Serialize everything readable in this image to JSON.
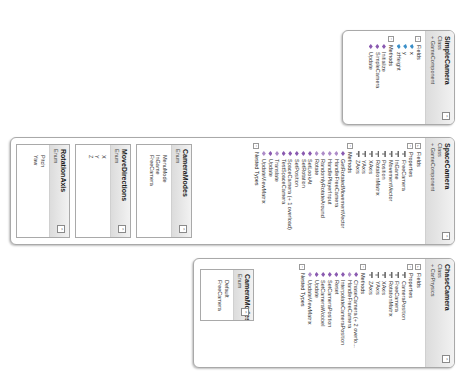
{
  "diagram": {
    "orientation": "rotated 90 degrees clockwise",
    "classes": [
      {
        "name": "SimpleCamera",
        "kind": "Class",
        "base": "+ GameComponent",
        "sections": [
          {
            "title": "Fields",
            "toggle": "−",
            "members": [
              {
                "name": "x",
                "type": "field"
              },
              {
                "name": "y",
                "type": "field"
              },
              {
                "name": "zHeight",
                "type": "field"
              }
            ]
          },
          {
            "title": "Methods",
            "toggle": "−",
            "members": [
              {
                "name": "Initialize",
                "type": "method"
              },
              {
                "name": "SimpleCamera",
                "type": "method"
              },
              {
                "name": "Update",
                "type": "method"
              }
            ]
          }
        ]
      },
      {
        "name": "SpaceCamera",
        "kind": "Class",
        "base": "+ GameComponent",
        "sections": [
          {
            "title": "Fields",
            "toggle": "+",
            "members": []
          },
          {
            "title": "Properties",
            "toggle": "−",
            "members": [
              {
                "name": "FreeCamera",
                "type": "property"
              },
              {
                "name": "InGame",
                "type": "property"
              },
              {
                "name": "MovementVector",
                "type": "property"
              },
              {
                "name": "Position",
                "type": "property"
              },
              {
                "name": "RotationMatrix",
                "type": "property"
              },
              {
                "name": "XAxis",
                "type": "property"
              },
              {
                "name": "YAxis",
                "type": "property"
              },
              {
                "name": "ZAxis",
                "type": "property"
              }
            ]
          },
          {
            "title": "Methods",
            "toggle": "−",
            "members": [
              {
                "name": "GetRotatedMovementVector",
                "type": "method"
              },
              {
                "name": "HandleFreeCamera",
                "type": "method-private"
              },
              {
                "name": "HandlePlayerInput",
                "type": "method-private"
              },
              {
                "name": "RandomlyRotateAround",
                "type": "method-private"
              },
              {
                "name": "Rotate",
                "type": "method-private"
              },
              {
                "name": "SetLookAt",
                "type": "method"
              },
              {
                "name": "SetRotation",
                "type": "method"
              },
              {
                "name": "SetPosition",
                "type": "method"
              },
              {
                "name": "SpaceCamera (+ 1 overload)",
                "type": "method"
              },
              {
                "name": "TestSpaceCamera",
                "type": "method"
              },
              {
                "name": "Translate",
                "type": "method-private"
              },
              {
                "name": "Update",
                "type": "method"
              },
              {
                "name": "UpdateViewMatrix",
                "type": "method-private"
              }
            ]
          },
          {
            "title": "Nested Types",
            "toggle": "−",
            "members": []
          }
        ],
        "nested_enums": [
          {
            "name": "CameraModes",
            "kind": "Enum",
            "values": [
              "MenuMode",
              "InGame",
              "FreeCamera"
            ]
          },
          {
            "name": "MoveDirections",
            "kind": "Enum",
            "values": [
              "X",
              "Y",
              "Z"
            ]
          },
          {
            "name": "RotationAxis",
            "kind": "Enum",
            "values": [
              "Pitch",
              "Yaw"
            ]
          }
        ]
      },
      {
        "name": "ChaseCamera",
        "kind": "Class",
        "base": "+ CarPhysics",
        "sections": [
          {
            "title": "Fields",
            "toggle": "+",
            "members": []
          },
          {
            "title": "Properties",
            "toggle": "−",
            "members": [
              {
                "name": "CameraPosition",
                "type": "property"
              },
              {
                "name": "FreeCamera",
                "type": "property"
              },
              {
                "name": "RotationMatrix",
                "type": "property"
              },
              {
                "name": "XAxis",
                "type": "property"
              },
              {
                "name": "YAxis",
                "type": "property"
              },
              {
                "name": "ZAxis",
                "type": "property"
              }
            ]
          },
          {
            "title": "Methods",
            "toggle": "−",
            "members": [
              {
                "name": "ChaseCamera (+ 2 overlo...",
                "type": "method"
              },
              {
                "name": "HandleFreeCamera",
                "type": "method-private"
              },
              {
                "name": "InterpolateCameraPosition",
                "type": "method"
              },
              {
                "name": "Reset",
                "type": "method"
              },
              {
                "name": "SetCameraPosition",
                "type": "method"
              },
              {
                "name": "SetCameraWobbel",
                "type": "method"
              },
              {
                "name": "Update",
                "type": "method"
              },
              {
                "name": "UpdateViewMatrix",
                "type": "method-private"
              }
            ]
          },
          {
            "title": "Nested Types",
            "toggle": "−",
            "members": []
          }
        ],
        "nested_enums": [
          {
            "name": "CameraModes",
            "kind": "Enum",
            "values": [
              "Default",
              "FreeCamera"
            ]
          }
        ]
      }
    ],
    "collapse_glyph": "⌃",
    "colors": {
      "header_top": "#f2f2f2",
      "header_bottom": "#dcdcdc",
      "border": "#a9a9a9",
      "method_icon": "#8a5ab0",
      "field_icon": "#3a8fc8",
      "property_icon": "#6a6a6a"
    }
  }
}
